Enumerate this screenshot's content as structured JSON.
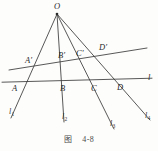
{
  "figure": {
    "caption_label": "图",
    "caption_number": "4-8",
    "apex": {
      "name": "O",
      "x": 57,
      "y": 13
    },
    "points_upper": [
      {
        "name": "A'",
        "x": 31,
        "y": 63
      },
      {
        "name": "B'",
        "x": 65,
        "y": 58
      },
      {
        "name": "C'",
        "x": 82,
        "y": 56
      },
      {
        "name": "D'",
        "x": 105,
        "y": 51
      }
    ],
    "points_lower": [
      {
        "name": "A",
        "x": 20,
        "y": 86
      },
      {
        "name": "B",
        "x": 65,
        "y": 83
      },
      {
        "name": "C",
        "x": 96,
        "y": 82
      },
      {
        "name": "D",
        "x": 122,
        "y": 80
      }
    ],
    "rays": [
      {
        "name": "l1",
        "label": "l",
        "sub": "1",
        "x": 13,
        "y": 112
      },
      {
        "name": "l2",
        "label": "l",
        "sub": "2",
        "x": 65,
        "y": 117
      },
      {
        "name": "l3",
        "label": "l",
        "sub": "3",
        "x": 113,
        "y": 124
      },
      {
        "name": "l4",
        "label": "l",
        "sub": "4",
        "x": 148,
        "y": 116
      }
    ],
    "transversal_lower": {
      "name": "l",
      "label": "l",
      "x": 150,
      "y": 80
    },
    "colors": {
      "stroke": "#3a3a3a",
      "background": "#fdfdfc",
      "label": "#2b2b2b"
    },
    "geometry": {
      "ray_endpoints": [
        {
          "x1": 57,
          "y1": 14,
          "x2": 11,
          "y2": 118
        },
        {
          "x1": 57,
          "y1": 14,
          "x2": 64,
          "y2": 122
        },
        {
          "x1": 57,
          "y1": 14,
          "x2": 114,
          "y2": 129
        },
        {
          "x1": 57,
          "y1": 14,
          "x2": 150,
          "y2": 120
        }
      ],
      "transversal_upper": {
        "x1": 9,
        "y1": 70,
        "x2": 147,
        "y2": 48
      },
      "transversal_lower_line": {
        "x1": 2,
        "y1": 82,
        "x2": 152,
        "y2": 78
      }
    }
  }
}
